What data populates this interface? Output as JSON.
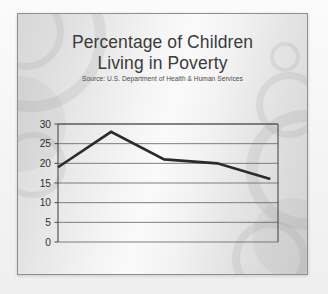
{
  "slide": {
    "title": "Percentage of Children\nLiving in Poverty",
    "subtitle": "Source: U.S. Department of Health & Human Services",
    "background_color": "#e9e9e9",
    "border_color": "#8f8f8f",
    "title_color": "#3b3b3b"
  },
  "chart_data": {
    "type": "line",
    "title": "Percentage of Children Living in Poverty",
    "subtitle": "Source: U.S. Department of Health & Human Services",
    "xlabel": "",
    "ylabel": "",
    "categories": [
      "2010",
      "2012",
      "2014",
      "2016",
      "2018"
    ],
    "x": [
      2010,
      2012,
      2014,
      2016,
      2018
    ],
    "values": [
      19,
      28,
      21,
      20,
      16
    ],
    "series": [
      {
        "name": "Percentage of Children Living in Poverty",
        "values": [
          19,
          28,
          21,
          20,
          16
        ]
      }
    ],
    "ylim": [
      0,
      30
    ],
    "yticks": [
      0,
      5,
      10,
      15,
      20,
      25,
      30
    ],
    "ytick_labels": [
      "0",
      "5",
      "10",
      "15",
      "20",
      "25",
      "30"
    ],
    "xtick_labels": [
      "2010",
      "2012",
      "2014",
      "2016",
      "2018"
    ],
    "grid": true,
    "grid_axis": "y",
    "legend": false,
    "legend_position": "none",
    "line_color": "#2b2b2b",
    "line_width": 2.6,
    "grid_color": "#6f6f6f",
    "axis_color": "#4a4a4a",
    "tick_label_color": "#2f2f2f"
  }
}
